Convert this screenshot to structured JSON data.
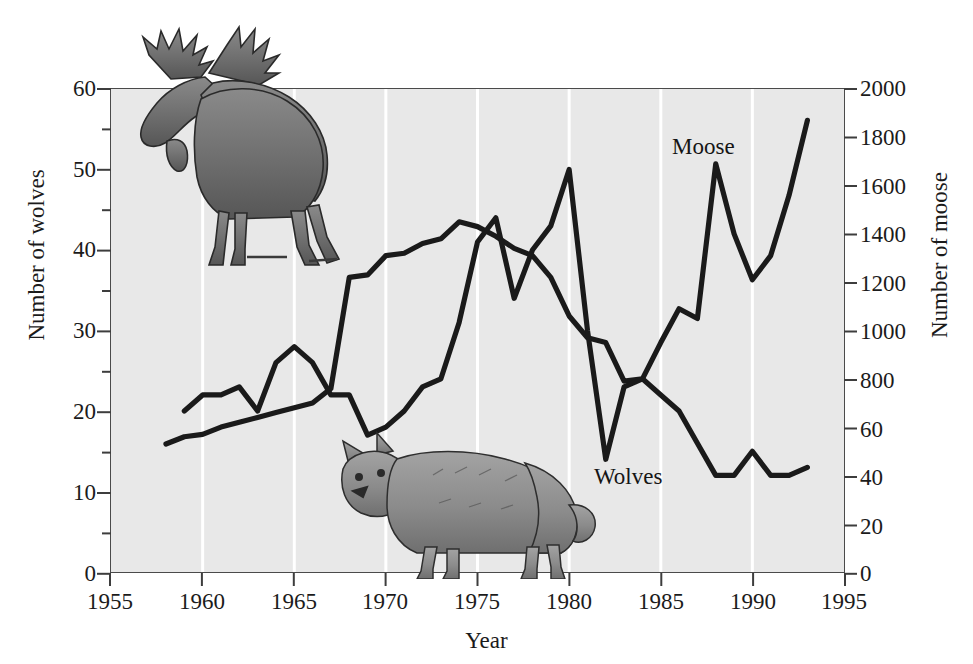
{
  "figure": {
    "background_color": "#ffffff",
    "plot_background_color": "#e8e8e8",
    "line_color": "#1a1a1a",
    "gridline_color": "#ffffff",
    "axis_color": "#4a4a4a"
  },
  "axes": {
    "x": {
      "label": "Year",
      "ticks": [
        "1955",
        "1960",
        "1965",
        "1970",
        "1975",
        "1980",
        "1985",
        "1990",
        "1995"
      ],
      "min": 1955,
      "max": 1995
    },
    "y_left": {
      "label": "Number of wolves",
      "ticks": [
        "0",
        "10",
        "20",
        "30",
        "40",
        "50",
        "60"
      ],
      "min": 0,
      "max": 60
    },
    "y_right": {
      "label": "Number of moose",
      "ticks": [
        "0",
        "20",
        "40",
        "60",
        "800",
        "1000",
        "1200",
        "1400",
        "1600",
        "1800",
        "2000"
      ],
      "min": 0,
      "max": 2000
    }
  },
  "series_labels": {
    "moose": "Moose",
    "wolves": "Wolves"
  },
  "illustrations": {
    "moose": "moose-illustration",
    "wolf": "wolf-illustration"
  },
  "chart_data": {
    "type": "line",
    "title": "",
    "xlabel": "Year",
    "ylabel": "Number of wolves",
    "ylabel_secondary": "Number of moose",
    "xlim": [
      1955,
      1995
    ],
    "ylim": [
      0,
      60
    ],
    "ylim_secondary": [
      0,
      2000
    ],
    "grid": "vertical-white-5yr",
    "legend": "inline-annotations",
    "series": [
      {
        "name": "Wolves",
        "axis": "left",
        "unit": "wolves",
        "x": [
          1959,
          1960,
          1961,
          1962,
          1963,
          1964,
          1965,
          1966,
          1967,
          1968,
          1969,
          1970,
          1971,
          1972,
          1973,
          1974,
          1975,
          1976,
          1977,
          1978,
          1979,
          1980,
          1981,
          1982,
          1983,
          1984,
          1985,
          1986,
          1987,
          1988,
          1989,
          1990,
          1991,
          1992,
          1993
        ],
        "values": [
          20,
          22,
          22,
          23,
          20,
          26,
          28,
          26,
          22,
          22,
          17,
          18,
          20,
          23,
          24,
          31,
          41,
          44,
          34,
          40,
          43,
          50,
          30,
          14,
          23,
          24,
          22,
          20,
          16,
          12,
          12,
          15,
          12,
          12,
          13
        ]
      },
      {
        "name": "Moose",
        "axis": "right",
        "unit": "moose",
        "x": [
          1958,
          1959,
          1960,
          1961,
          1962,
          1963,
          1964,
          1965,
          1966,
          1967,
          1968,
          1969,
          1970,
          1971,
          1972,
          1973,
          1974,
          1975,
          1976,
          1977,
          1978,
          1979,
          1980,
          1981,
          1982,
          1983,
          1984,
          1985,
          1986,
          1987,
          1988,
          1989,
          1990,
          1991,
          1992,
          1993
        ],
        "values": [
          530,
          560,
          570,
          600,
          620,
          640,
          660,
          680,
          700,
          760,
          1220,
          1230,
          1310,
          1320,
          1360,
          1380,
          1450,
          1430,
          1390,
          1340,
          1310,
          1220,
          1060,
          970,
          950,
          790,
          800,
          950,
          1090,
          1050,
          1690,
          1400,
          1210,
          1310,
          1560,
          1870
        ]
      }
    ]
  }
}
